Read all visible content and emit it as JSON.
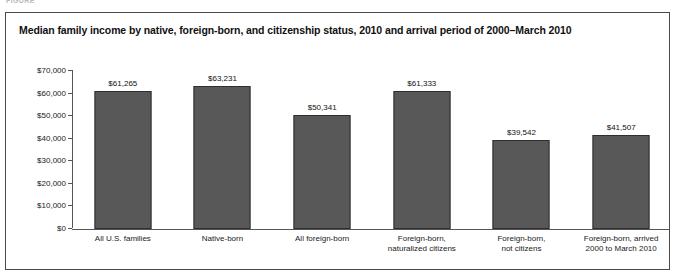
{
  "figure_header": "FIGURE",
  "chart_data": {
    "type": "bar",
    "title": "Median family income by native, foreign-born, and citizenship status, 2010 and arrival period of 2000–March 2010",
    "xlabel": "",
    "ylabel": "",
    "ylim": [
      0,
      70000
    ],
    "grid": false,
    "legend": null,
    "ytick_labels": [
      "$70,000",
      "$60,000",
      "$50,000",
      "$40,000",
      "$30,000",
      "$20,000",
      "$10,000",
      "$0"
    ],
    "ytick_values": [
      70000,
      60000,
      50000,
      40000,
      30000,
      20000,
      10000,
      0
    ],
    "categories": [
      "All U.S. families",
      "Native-born",
      "All foreign-born",
      "Foreign-born,\nnaturalized citizens",
      "Foreign-born,\nnot citizens",
      "Foreign-born, arrived\n2000 to March 2010"
    ],
    "category_lines": [
      [
        "All U.S. families"
      ],
      [
        "Native-born"
      ],
      [
        "All foreign-born"
      ],
      [
        "Foreign-born,",
        "naturalized citizens"
      ],
      [
        "Foreign-born,",
        "not citizens"
      ],
      [
        "Foreign-born, arrived",
        "2000 to March 2010"
      ]
    ],
    "values": [
      61265,
      63231,
      50341,
      61333,
      39542,
      41507
    ],
    "value_labels": [
      "$61,265",
      "$63,231",
      "$50,341",
      "$61,333",
      "$39,542",
      "$41,507"
    ],
    "colors": {
      "bar_fill": "#585858",
      "bar_edge": "#2e2e2e",
      "axis": "#555555",
      "text": "#111111",
      "frame": "#4a4a4a"
    }
  }
}
